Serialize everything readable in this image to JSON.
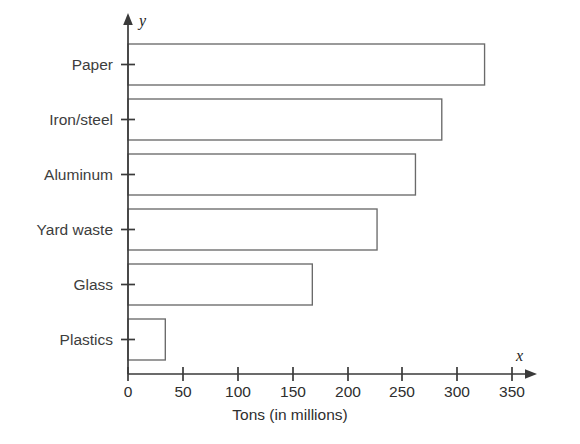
{
  "chart_data": {
    "type": "bar",
    "orientation": "horizontal",
    "title": "",
    "xlabel": "Tons (in millions)",
    "ylabel": "",
    "x_axis_name": "x",
    "y_axis_name": "y",
    "categories": [
      "Plastics",
      "Glass",
      "Yard waste",
      "Aluminum",
      "Iron/steel",
      "Paper"
    ],
    "values": [
      34,
      168,
      227,
      262,
      286,
      325
    ],
    "xlim": [
      0,
      360
    ],
    "xticks": [
      0,
      50,
      100,
      150,
      200,
      250,
      300,
      350
    ],
    "xtick_labels": [
      "0",
      "50",
      "100",
      "150",
      "200",
      "250",
      "300",
      "350"
    ],
    "grid": false,
    "legend": null,
    "bar_fill": "#ffffff",
    "bar_stroke": "#6a6a6a",
    "axis_color": "#3a3a3a",
    "background": "#ffffff"
  },
  "labels": {
    "cat_0": "Plastics",
    "cat_1": "Glass",
    "cat_2": "Yard waste",
    "cat_3": "Aluminum",
    "cat_4": "Iron/steel",
    "cat_5": "Paper",
    "tick_0": "0",
    "tick_1": "50",
    "tick_2": "100",
    "tick_3": "150",
    "tick_4": "200",
    "tick_5": "250",
    "tick_6": "300",
    "tick_7": "350",
    "x_axis_title": "Tons (in millions)",
    "x_axis_name": "x",
    "y_axis_name": "y"
  }
}
